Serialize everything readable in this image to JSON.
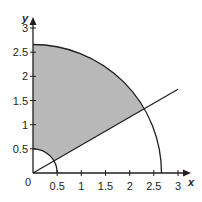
{
  "figure": {
    "type": "polar-region-diagram",
    "colors": {
      "shade": "#b8b8b8",
      "stroke": "#231f20",
      "background": "#ffffff"
    },
    "axes": {
      "x_label": "x",
      "y_label": "y",
      "origin_label": "0",
      "x_ticks": [
        {
          "value": 0.5,
          "label": "0.5"
        },
        {
          "value": 1,
          "label": "1"
        },
        {
          "value": 1.5,
          "label": "1.5"
        },
        {
          "value": 2,
          "label": "2"
        },
        {
          "value": 2.5,
          "label": "2.5"
        },
        {
          "value": 3,
          "label": "3"
        }
      ],
      "y_ticks": [
        {
          "value": 0.5,
          "label": "0.5"
        },
        {
          "value": 1,
          "label": "1"
        },
        {
          "value": 1.5,
          "label": "1.5"
        },
        {
          "value": 2,
          "label": "2"
        },
        {
          "value": 2.5,
          "label": "2.5"
        },
        {
          "value": 3,
          "label": "3"
        }
      ],
      "xlim": [
        0,
        3.2
      ],
      "ylim": [
        0,
        3.2
      ]
    },
    "curves": {
      "large_circle_radius": 2.65,
      "small_circle_radius": 0.5,
      "ray_angle_deg": 30,
      "ray_end_x": 2.98
    }
  }
}
